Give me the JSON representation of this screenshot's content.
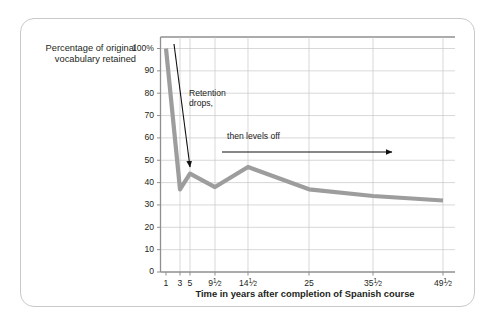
{
  "card": {
    "border_color": "#c9c9c9"
  },
  "chart_data": {
    "type": "line",
    "title": "",
    "xlabel": "Time in years after completion of Spanish course",
    "ylabel": "Percentage of original vocabulary retained",
    "ylim": [
      0,
      107
    ],
    "xlim": [
      0,
      8
    ],
    "grid": true,
    "legend": "none",
    "line_color": "#9d9d9d",
    "line_width": 4.2,
    "categories": [
      "1",
      "3",
      "5",
      "9½",
      "14½",
      "25",
      "35½",
      "49½"
    ],
    "values": [
      100,
      37,
      44,
      38,
      47,
      37,
      34,
      32
    ],
    "x_positions": [
      166,
      180,
      190,
      215,
      248,
      309,
      373,
      443
    ],
    "yticks": [
      {
        "label": "100%",
        "value": 100
      },
      {
        "label": "90",
        "value": 90
      },
      {
        "label": "80",
        "value": 80
      },
      {
        "label": "70",
        "value": 70
      },
      {
        "label": "60",
        "value": 60
      },
      {
        "label": "50",
        "value": 50
      },
      {
        "label": "40",
        "value": 40
      },
      {
        "label": "30",
        "value": 30
      },
      {
        "label": "20",
        "value": 20
      },
      {
        "label": "10",
        "value": 10
      },
      {
        "label": "0",
        "value": 0
      }
    ],
    "xticks": [
      {
        "whole": "1",
        "num": "",
        "den": ""
      },
      {
        "whole": "3",
        "num": "",
        "den": ""
      },
      {
        "whole": "5",
        "num": "",
        "den": ""
      },
      {
        "whole": "9",
        "num": "1",
        "den": "2"
      },
      {
        "whole": "14",
        "num": "1",
        "den": "2"
      },
      {
        "whole": "25",
        "num": "",
        "den": ""
      },
      {
        "whole": "35",
        "num": "1",
        "den": "2"
      },
      {
        "whole": "49",
        "num": "1",
        "den": "2"
      }
    ],
    "annotations": [
      {
        "text": "Retention\ndrops,",
        "x": 189,
        "y": 88
      },
      {
        "text": "then levels off",
        "x": 227,
        "y": 131
      }
    ],
    "arrows": [
      {
        "name": "retention-drops-arrow",
        "x1": 174,
        "y1": 44,
        "x2": 190,
        "y2": 167
      },
      {
        "name": "levels-off-arrow",
        "x1": 222,
        "y1": 152,
        "x2": 392,
        "y2": 152
      }
    ]
  }
}
